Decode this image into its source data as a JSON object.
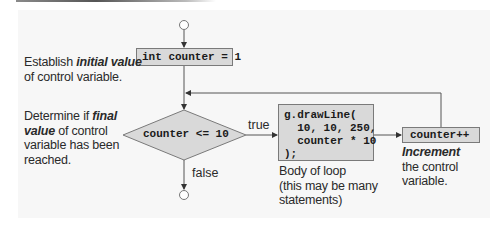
{
  "diagram": {
    "type": "flowchart",
    "nodes": {
      "start": {
        "shape": "circle"
      },
      "init": {
        "shape": "rect",
        "code": "int counter = 1"
      },
      "condition": {
        "shape": "diamond",
        "code": "counter <= 10"
      },
      "body": {
        "shape": "rect",
        "code_lines": [
          "g.drawLine(",
          "  10, 10, 250,",
          "  counter * 10",
          ");"
        ]
      },
      "increment": {
        "shape": "rect",
        "code": "counter++"
      },
      "end": {
        "shape": "circle"
      }
    },
    "edges": {
      "true_label": "true",
      "false_label": "false"
    },
    "annotations": {
      "init": {
        "prefix": "Establish ",
        "emphasis": "initial value",
        "suffix": "of control variable."
      },
      "condition": {
        "prefix": "Determine if ",
        "emphasis1": "final",
        "emphasis2": "value",
        "suffix1": " of control",
        "suffix2": "variable has been",
        "suffix3": "reached."
      },
      "body": {
        "line1": "Body of loop",
        "line2": "(this may be many",
        "line3": "statements)"
      },
      "increment": {
        "emphasis": "Increment",
        "line2": "the control",
        "line3": "variable."
      }
    },
    "colors": {
      "box_fill": "#d9d9d9",
      "box_border": "#7a7a7a",
      "line": "#555555",
      "background": "#f7f7f7"
    }
  }
}
